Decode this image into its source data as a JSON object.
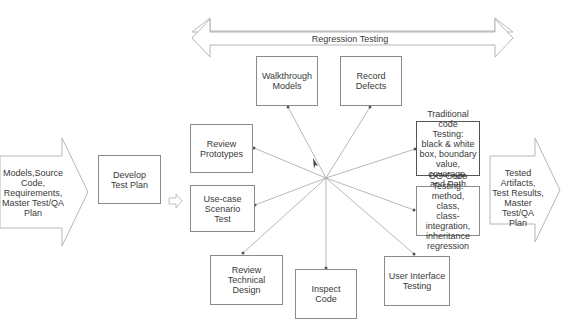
{
  "diagram": {
    "input_arrow": {
      "label": "Models,Source\nCode,\nRequirements,\nMaster Test/QA\nPlan"
    },
    "develop_box": {
      "label": "Develop\nTest Plan"
    },
    "regression_arrow": {
      "label": "Regression Testing"
    },
    "activities": [
      {
        "id": "walkthrough",
        "label": "Walkthrough\nModels"
      },
      {
        "id": "record",
        "label": "Record\nDefects"
      },
      {
        "id": "prototypes",
        "label": "Review\nPrototypes"
      },
      {
        "id": "usecase",
        "label": "Use-case Scenario\nTest"
      },
      {
        "id": "techdesign",
        "label": "Review\nTechnical Design"
      },
      {
        "id": "inspect",
        "label": "Inspect\nCode"
      },
      {
        "id": "ui",
        "label": "User Interface\nTesting"
      },
      {
        "id": "traditional",
        "label": "Traditional code\nTesting:\nblack & white\nbox, boundary\nvalue, coverage,\nand Path"
      },
      {
        "id": "oo",
        "label": "OO Code Testing:\nmethod, class,\nclass-integration,\ninheritance\nregression"
      }
    ],
    "output_arrow": {
      "label": "Tested Artifacts,\nTest Results,\nMaster Test/QA\nPlan"
    }
  }
}
